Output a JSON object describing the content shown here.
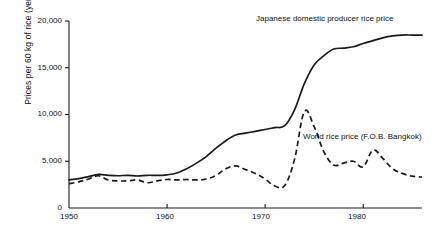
{
  "chart_data": {
    "type": "line",
    "title": "",
    "subtitle": "",
    "xlabel": "",
    "ylabel": "Prices per 60 kg of rice (yen)",
    "xlim": [
      1950,
      1986
    ],
    "ylim": [
      0,
      20000
    ],
    "grid": false,
    "legend_position": "inline-annotation",
    "x_ticks": [
      "1950",
      "1960",
      "1970",
      "1980"
    ],
    "x_tick_values": [
      1950,
      1960,
      1970,
      1980
    ],
    "y_ticks": [
      "0",
      "5,000",
      "10,000",
      "15,000",
      "20,000"
    ],
    "y_tick_values": [
      0,
      5000,
      10000,
      15000,
      20000
    ],
    "series": [
      {
        "name": "Japanese domestic producer rice price",
        "style": "solid",
        "color": "#1a1a1a",
        "x": [
          1950,
          1951,
          1952,
          1953,
          1954,
          1955,
          1956,
          1957,
          1958,
          1959,
          1960,
          1961,
          1962,
          1963,
          1964,
          1965,
          1966,
          1967,
          1968,
          1969,
          1970,
          1971,
          1972,
          1973,
          1974,
          1975,
          1976,
          1977,
          1978,
          1979,
          1980,
          1981,
          1982,
          1983,
          1984,
          1985,
          1986
        ],
        "values": [
          3000,
          3150,
          3350,
          3600,
          3500,
          3450,
          3500,
          3420,
          3500,
          3480,
          3550,
          3750,
          4200,
          4800,
          5500,
          6400,
          7200,
          7800,
          8000,
          8200,
          8400,
          8600,
          8800,
          10500,
          13300,
          15300,
          16300,
          17000,
          17100,
          17250,
          17600,
          17900,
          18200,
          18400,
          18500,
          18500,
          18500
        ]
      },
      {
        "name": "World rice price (F.O.B. Bangkok)",
        "style": "dashed",
        "color": "#1a1a1a",
        "x": [
          1950,
          1951,
          1952,
          1953,
          1954,
          1955,
          1956,
          1957,
          1958,
          1959,
          1960,
          1961,
          1962,
          1963,
          1964,
          1965,
          1966,
          1967,
          1968,
          1969,
          1970,
          1971,
          1972,
          1973,
          1974,
          1975,
          1976,
          1977,
          1978,
          1979,
          1980,
          1981,
          1982,
          1983,
          1984,
          1985,
          1986
        ],
        "values": [
          2600,
          2800,
          3100,
          3450,
          3000,
          2900,
          2900,
          3000,
          2700,
          2900,
          3050,
          3000,
          3050,
          3000,
          3100,
          3500,
          4200,
          4500,
          4100,
          3700,
          3100,
          2350,
          2400,
          5200,
          10300,
          8700,
          6000,
          4600,
          4800,
          5000,
          4400,
          6200,
          5300,
          4200,
          3700,
          3400,
          3300
        ]
      }
    ],
    "annotations": [
      {
        "text": "Japanese domestic producer rice price",
        "series": "Japanese domestic producer rice price",
        "x_px": 256,
        "y_px": 18
      },
      {
        "text": "World rice price (F.O.B. Bangkok)",
        "series": "World rice price (F.O.B. Bangkok)",
        "x_px": 303,
        "y_px": 136
      }
    ]
  },
  "axes": {
    "y_label": "Prices per 60 kg of rice (yen)",
    "y_tick_labels": [
      "20,000",
      "15,000",
      "10,000",
      "5,000",
      "0"
    ],
    "x_tick_labels": [
      "1950",
      "1960",
      "1970",
      "1980"
    ]
  },
  "annotations": {
    "japan_label": "Japanese domestic producer rice price",
    "world_label": "World rice price (F.O.B. Bangkok)"
  },
  "colors": {
    "line": "#1a1a1a",
    "axis": "#1a1a1a",
    "background": "#ffffff"
  }
}
